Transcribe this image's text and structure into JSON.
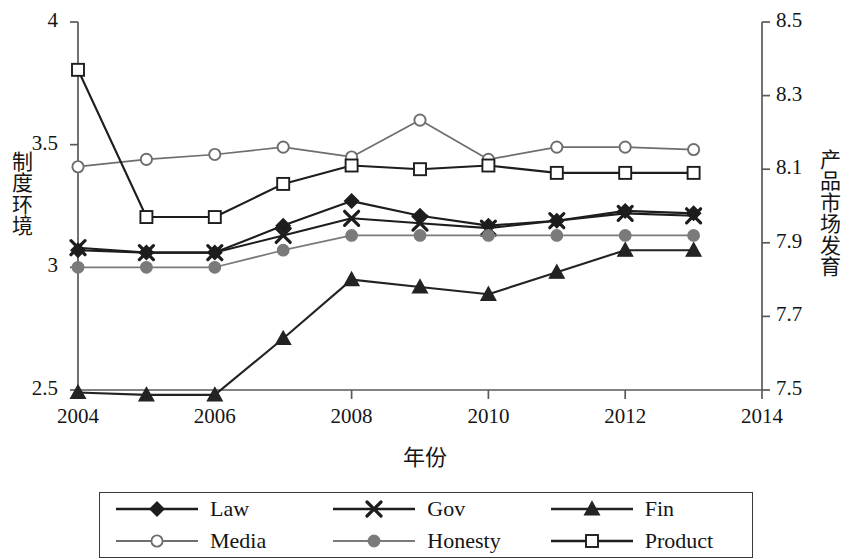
{
  "chart_data": {
    "type": "line",
    "title": "",
    "xlabel": "年份",
    "ylabel": "制度环境",
    "y2label": "产品市场发育",
    "x": [
      2004,
      2005,
      2006,
      2007,
      2008,
      2009,
      2010,
      2011,
      2012,
      2013
    ],
    "xlim": [
      2004,
      2014
    ],
    "xticks": [
      2004,
      2006,
      2008,
      2010,
      2012,
      2014
    ],
    "xtick_labels": [
      "2004",
      "2006",
      "2008",
      "2010",
      "2012",
      "2014"
    ],
    "ylim": [
      2.5,
      4.0
    ],
    "yticks": [
      2.5,
      3.0,
      3.5,
      4.0
    ],
    "ytick_labels": [
      "2.5",
      "3",
      "3.5",
      "4"
    ],
    "y2lim": [
      7.5,
      8.5
    ],
    "y2ticks": [
      7.5,
      7.7,
      7.9,
      8.1,
      8.3,
      8.5
    ],
    "y2tick_labels": [
      "7.5",
      "7.7",
      "7.9",
      "8.1",
      "8.3",
      "8.5"
    ],
    "grid": false,
    "legend_position": "bottom",
    "series": [
      {
        "name": "Law",
        "axis": "left",
        "marker": "filled-diamond",
        "color": "#1d1d1d",
        "values": [
          3.07,
          3.06,
          3.06,
          3.17,
          3.27,
          3.21,
          3.17,
          3.19,
          3.23,
          3.22
        ]
      },
      {
        "name": "Gov",
        "axis": "left",
        "marker": "cross-x",
        "color": "#1d1d1d",
        "values": [
          3.08,
          3.06,
          3.06,
          3.13,
          3.2,
          3.18,
          3.16,
          3.19,
          3.22,
          3.21
        ]
      },
      {
        "name": "Fin",
        "axis": "left",
        "marker": "filled-triangle",
        "color": "#232323",
        "values": [
          2.49,
          2.48,
          2.48,
          2.71,
          2.95,
          2.92,
          2.89,
          2.98,
          3.07,
          3.07
        ]
      },
      {
        "name": "Media",
        "axis": "left",
        "marker": "open-circle",
        "color": "#6e6e6e",
        "values": [
          3.41,
          3.44,
          3.46,
          3.49,
          3.45,
          3.6,
          3.44,
          3.49,
          3.49,
          3.48
        ]
      },
      {
        "name": "Honesty",
        "axis": "left",
        "marker": "filled-circle",
        "color": "#7a7a7a",
        "values": [
          3.0,
          3.0,
          3.0,
          3.07,
          3.13,
          3.13,
          3.13,
          3.13,
          3.13,
          3.13
        ]
      },
      {
        "name": "Product",
        "axis": "right",
        "marker": "open-square",
        "color": "#1d1d1d",
        "values": [
          8.37,
          7.97,
          7.97,
          8.06,
          8.11,
          8.1,
          8.11,
          8.09,
          8.09,
          8.09
        ]
      }
    ]
  },
  "axes": {
    "y_left_title": "制度环境",
    "y_right_title": "产品市场发育",
    "x_title": "年份"
  },
  "legend": {
    "items": [
      {
        "label": "Law",
        "marker": "filled-diamond",
        "color": "#1d1d1d"
      },
      {
        "label": "Gov",
        "marker": "cross-x",
        "color": "#1d1d1d"
      },
      {
        "label": "Fin",
        "marker": "filled-triangle",
        "color": "#232323"
      },
      {
        "label": "Media",
        "marker": "open-circle",
        "color": "#6e6e6e"
      },
      {
        "label": "Honesty",
        "marker": "filled-circle",
        "color": "#7a7a7a"
      },
      {
        "label": "Product",
        "marker": "open-square",
        "color": "#1d1d1d"
      }
    ]
  }
}
